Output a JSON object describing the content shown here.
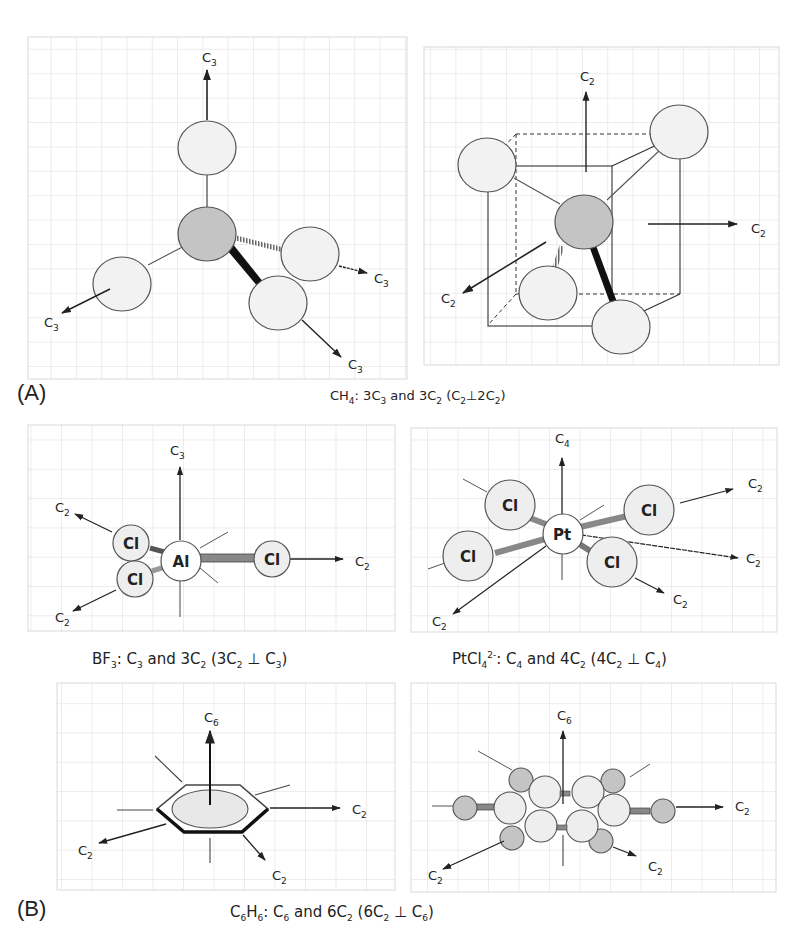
{
  "figure": {
    "part_a": {
      "letter": "(A)",
      "caption": {
        "pre": "CH",
        "sub1": "4",
        "mid1": ": 3C",
        "sub2": "3",
        "mid2": " and 3C",
        "sub3": "2",
        "mid3": " (C",
        "sub4": "2",
        "mid4": "⊥2C",
        "sub5": "2",
        "end": ")"
      },
      "panels": [
        {
          "name": "ch4-c3-view",
          "axes": [
            "C3",
            "C3",
            "C3",
            "C3"
          ],
          "axis_label": "C",
          "axis_sub": "3"
        },
        {
          "name": "ch4-c2-cube-view",
          "axes": [
            "C2",
            "C2",
            "C2"
          ],
          "axis_label": "C",
          "axis_sub": "2"
        }
      ]
    },
    "part_b": {
      "letter": "(B)",
      "bf3": {
        "caption": {
          "pre": "BF",
          "sub1": "3",
          "mid1": ": C",
          "sub2": "3",
          "mid2": " and 3C",
          "sub3": "2",
          "mid3": " (3C",
          "sub4": "2",
          "mid4": " ⊥ C",
          "sub5": "3",
          "end": ")"
        },
        "central_atom": "Al",
        "ligand": "Cl",
        "principal_axis": {
          "label": "C",
          "sub": "3"
        },
        "secondary_axis": {
          "label": "C",
          "sub": "2"
        }
      },
      "ptcl4": {
        "caption": {
          "pre": "PtCl",
          "sub1": "4",
          "sup": "2-",
          "mid1": ":  C",
          "sub2": "4",
          "mid2": " and 4C",
          "sub3": "2",
          "mid3": " (4C",
          "sub4": "2",
          "mid4": " ⊥ C",
          "sub5": "4",
          "end": ")"
        },
        "central_atom": "Pt",
        "ligand": "Cl",
        "principal_axis": {
          "label": "C",
          "sub": "4"
        },
        "secondary_axis": {
          "label": "C",
          "sub": "2"
        }
      },
      "benzene": {
        "caption": {
          "pre": "C",
          "sub1": "6",
          "mid1": "H",
          "sub2": "6",
          "mid2": ":  C",
          "sub3": "6",
          "mid3": " and 6C",
          "sub4": "2",
          "mid4": " (6C",
          "sub5": "2",
          "mid5": " ⊥ C",
          "sub6": "6",
          "end": ")"
        },
        "principal_axis": {
          "label": "C",
          "sub": "6"
        },
        "secondary_axis": {
          "label": "C",
          "sub": "2"
        }
      }
    },
    "colors": {
      "grid": "#d9d9d9",
      "atom_light": "#f2f2f2",
      "atom_dark": "#c4c4c4",
      "stroke": "#444444"
    }
  }
}
